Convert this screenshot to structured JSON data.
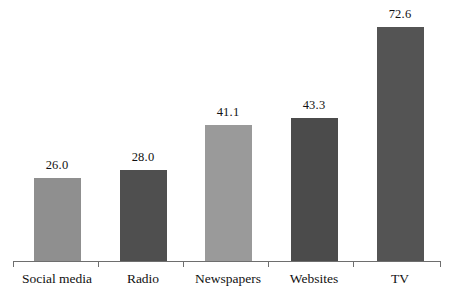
{
  "chart_data": {
    "type": "bar",
    "title": "",
    "subtitle": "",
    "xlabel": "",
    "ylabel": "",
    "categories": [
      "Social media",
      "Radio",
      "Newspapers",
      "Websites",
      "TV"
    ],
    "values": [
      26.0,
      28.0,
      41.1,
      43.3,
      72.6
    ],
    "value_labels": [
      "26.0",
      "28.0",
      "41.1",
      "43.3",
      "72.6"
    ],
    "bar_colors": [
      "#8f8f8f",
      "#4f4f4f",
      "#9a9a9a",
      "#4b4b4b",
      "#545454"
    ],
    "ylim": [
      0,
      79
    ],
    "grid": false,
    "legend": "none",
    "axis_color": "#6e6e6e",
    "background": "#ffffff"
  },
  "axis": {
    "baseline_y": 261,
    "tick_positions": [
      13,
      98,
      183,
      268,
      353,
      440
    ]
  },
  "bars": [
    {
      "label": "Social media",
      "value_label": "26.0",
      "left": 34,
      "width": 47,
      "top": 178,
      "color": "#8f8f8f",
      "center": 57
    },
    {
      "label": "Radio",
      "value_label": "28.0",
      "left": 120,
      "width": 47,
      "top": 170,
      "color": "#4f4f4f",
      "center": 143
    },
    {
      "label": "Newspapers",
      "value_label": "41.1",
      "left": 205,
      "width": 47,
      "top": 125,
      "color": "#9a9a9a",
      "center": 228
    },
    {
      "label": "Websites",
      "value_label": "43.3",
      "left": 291,
      "width": 47,
      "top": 118,
      "color": "#4b4b4b",
      "center": 314
    },
    {
      "label": "TV",
      "value_label": "72.6",
      "left": 377,
      "width": 47,
      "top": 27,
      "color": "#545454",
      "center": 400
    }
  ]
}
